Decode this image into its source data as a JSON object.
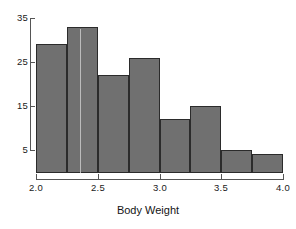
{
  "chart_data": {
    "type": "bar",
    "title": "",
    "subtitle": "",
    "xlabel": "Body Weight",
    "ylabel": "",
    "bin_width": 0.25,
    "bin_edges": [
      2.0,
      2.25,
      2.5,
      2.75,
      3.0,
      3.25,
      3.5,
      3.75,
      4.0
    ],
    "categories": [
      "2.00-2.25",
      "2.25-2.50",
      "2.50-2.75",
      "2.75-3.00",
      "3.00-3.25",
      "3.25-3.50",
      "3.50-3.75",
      "3.75-4.00"
    ],
    "values": [
      29,
      33,
      22,
      26,
      12,
      15,
      5,
      4
    ],
    "xlim": [
      2.0,
      4.0
    ],
    "ylim": [
      0,
      35
    ],
    "xticks": [
      2.0,
      2.5,
      3.0,
      3.5,
      4.0
    ],
    "xticklabels": [
      "2.0",
      "2.5",
      "3.0",
      "3.5",
      "4.0"
    ],
    "yticks": [
      5,
      15,
      25,
      35
    ],
    "yticklabels": [
      "5",
      "15",
      "25",
      "35"
    ],
    "grid": false,
    "legend": null,
    "bar_fill_color": "#707070",
    "bar_edge_color": "#2b2b2b",
    "axis_color": "#555555",
    "background_color": "#ffffff"
  },
  "axes": {
    "x_title": "Body Weight",
    "x_ticks": [
      {
        "label": "2.0",
        "value": 2.0
      },
      {
        "label": "2.5",
        "value": 2.5
      },
      {
        "label": "3.0",
        "value": 3.0
      },
      {
        "label": "3.5",
        "value": 3.5
      },
      {
        "label": "4.0",
        "value": 4.0
      }
    ],
    "y_ticks": [
      {
        "label": "35",
        "value": 35
      },
      {
        "label": "25",
        "value": 25
      },
      {
        "label": "15",
        "value": 15
      },
      {
        "label": "5",
        "value": 5
      }
    ]
  }
}
